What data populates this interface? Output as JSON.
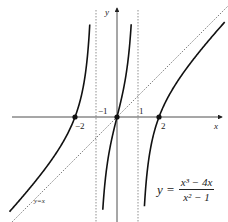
{
  "chart_data": {
    "type": "line",
    "title": "",
    "function": "y = (x^3 - 4x)/(x^2 - 1)",
    "formula_label": {
      "lhs": "y =",
      "numerator": "x³ − 4x",
      "denominator": "x² − 1"
    },
    "xlabel": "x",
    "ylabel": "y",
    "x_ticks": [
      {
        "value": -2,
        "label": "−2"
      },
      {
        "value": -1,
        "label": "−1"
      },
      {
        "value": 1,
        "label": "1"
      },
      {
        "value": 2,
        "label": "2"
      }
    ],
    "vertical_asymptotes": [
      -1,
      1
    ],
    "oblique_asymptote": {
      "equation": "y = x",
      "label": "y=x"
    },
    "zeros": [
      -2,
      0,
      2
    ],
    "xlim": [
      -5.5,
      5.3
    ],
    "ylim": [
      -5,
      5.5
    ],
    "grid": false,
    "legend": "none"
  }
}
